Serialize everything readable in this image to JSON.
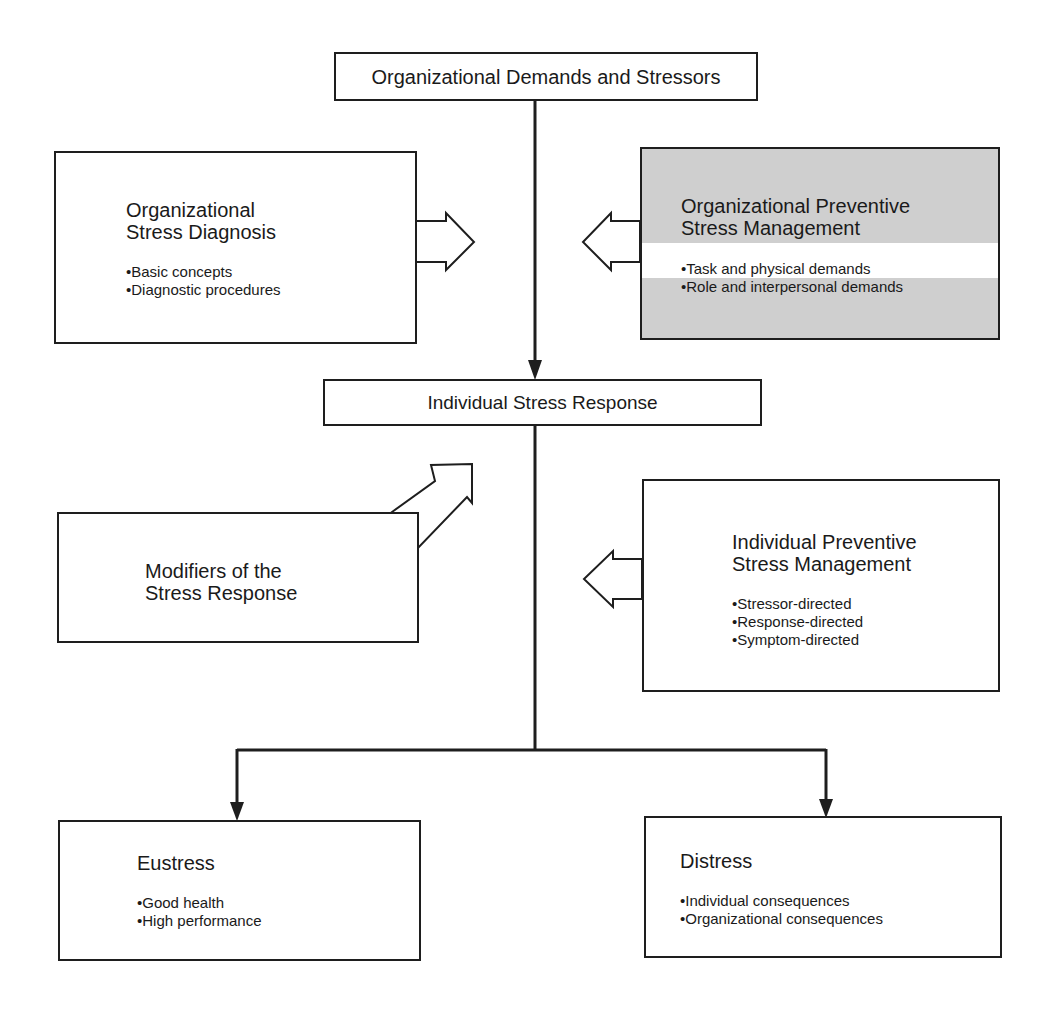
{
  "diagram": {
    "top": {
      "title": "Organizational Demands and Stressors"
    },
    "org_diagnosis": {
      "title_lines": [
        "Organizational",
        "Stress Diagnosis"
      ],
      "bullets": [
        "Basic concepts",
        "Diagnostic procedures"
      ]
    },
    "org_preventive": {
      "title_lines": [
        "Organizational Preventive",
        "Stress Management"
      ],
      "bullets": [
        "Task and physical demands",
        "Role and interpersonal demands"
      ],
      "fill_color": "#cfcfcf"
    },
    "individual_response": {
      "title": "Individual Stress Response"
    },
    "modifiers": {
      "title_lines": [
        "Modifiers of  the",
        "Stress Response"
      ]
    },
    "individual_preventive": {
      "title_lines": [
        "Individual Preventive",
        "Stress Management"
      ],
      "bullets": [
        "Stressor-directed",
        "Response-directed",
        "Symptom-directed"
      ]
    },
    "eustress": {
      "title": "Eustress",
      "bullets": [
        "Good health",
        "High performance"
      ]
    },
    "distress": {
      "title": "Distress",
      "bullets": [
        "Individual consequences",
        "Organizational consequences"
      ]
    }
  }
}
